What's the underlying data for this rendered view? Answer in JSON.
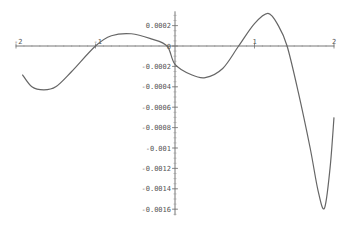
{
  "chart_data": {
    "type": "line",
    "title": "",
    "xlabel": "",
    "ylabel": "",
    "xlim": [
      -2,
      2
    ],
    "ylim": [
      -0.0016,
      0.0003
    ],
    "grid": false,
    "legend": null,
    "x_ticks": [
      "-2",
      "-1",
      "0",
      "1",
      "2"
    ],
    "y_ticks": [
      "0.0002",
      "0",
      "-0.0002",
      "-0.0004",
      "-0.0006",
      "-0.0008",
      "-0.001",
      "-0.0012",
      "-0.0014",
      "-0.0016"
    ],
    "series": [
      {
        "name": "f(x)",
        "color": "#666666",
        "x": [
          -1.92,
          -1.8,
          -1.65,
          -1.5,
          -1.3,
          -1.0,
          -0.8,
          -0.55,
          -0.3,
          -0.1,
          0.0,
          0.2,
          0.38,
          0.6,
          0.8,
          1.0,
          1.17,
          1.3,
          1.41,
          1.55,
          1.7,
          1.8,
          1.88,
          1.95,
          2.0
        ],
        "y": [
          -0.00028,
          -0.0004,
          -0.00043,
          -0.0004,
          -0.00025,
          0.0,
          0.0001,
          0.00012,
          7e-05,
          0.0,
          -0.00018,
          -0.00028,
          -0.00031,
          -0.00022,
          0.0,
          0.00022,
          0.00032,
          0.0002,
          0.0,
          -0.00045,
          -0.001,
          -0.00142,
          -0.00159,
          -0.0012,
          -0.0007
        ]
      }
    ]
  }
}
